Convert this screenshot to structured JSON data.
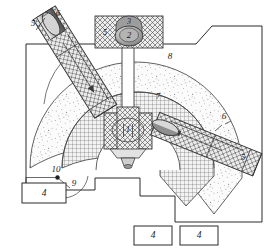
{
  "figure": {
    "background_color": "#ffffff",
    "line_color": "#2a2a2a",
    "labels": {
      "center_shaft_block": "1",
      "top_rotor": "2",
      "top_cap": "3",
      "bottom_box_left": "4",
      "bottom_box_center": "4",
      "bottom_box_right": "4",
      "beam_upper_left_body": "5",
      "beam_upper_left_lead": "6",
      "beam_lower_right_body": "5",
      "beam_lower_right_lead": "6",
      "top_block_left": "5",
      "dome_hatched": "7",
      "stipple_region": "8",
      "arc_marker": "9",
      "node_marker": "10"
    },
    "parts": [
      {
        "ref": "1",
        "name": "center-shaft-block",
        "hatch": "crosshatch"
      },
      {
        "ref": "2",
        "name": "top-rotor",
        "hatch": "shaded-ellipse"
      },
      {
        "ref": "3",
        "name": "top-cap",
        "hatch": "shaded-arc"
      },
      {
        "ref": "4",
        "name": "external-unit-box",
        "hatch": "none"
      },
      {
        "ref": "5",
        "name": "beam-body",
        "hatch": "crosshatch"
      },
      {
        "ref": "6",
        "name": "beam-leader",
        "hatch": "none"
      },
      {
        "ref": "7",
        "name": "dome-core",
        "hatch": "fine-grid"
      },
      {
        "ref": "8",
        "name": "stipple-shell",
        "hatch": "stipple"
      },
      {
        "ref": "9",
        "name": "arc-detail",
        "hatch": "none"
      },
      {
        "ref": "10",
        "name": "connection-node",
        "hatch": "none"
      }
    ]
  }
}
